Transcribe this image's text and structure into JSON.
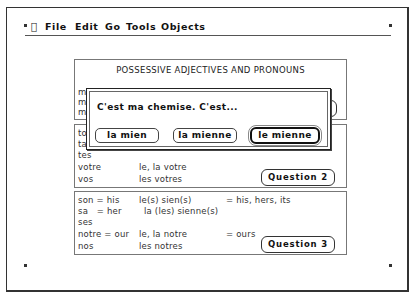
{
  "menubar": {
    "apple_icon": "",
    "items": [
      "File",
      "Edit",
      "Go",
      "Tools",
      "Objects"
    ]
  },
  "panel1": {
    "title": "POSSESSIVE ADJECTIVES AND PRONOUNS",
    "rows": [
      {
        "adj": "mon",
        "pron": "le(s) mien(s)",
        "meaning": "= mine",
        "obscured": true
      },
      {
        "adj": "ma"
      },
      {
        "adj": "mes"
      }
    ],
    "button": "Question 1"
  },
  "panel2": {
    "rows": [
      {
        "adj": "ton",
        "pron": ""
      },
      {
        "adj": "ta",
        "pron": ""
      },
      {
        "adj": "tes",
        "pron": ""
      },
      {
        "adj": "votre",
        "pron": "le, la votre"
      },
      {
        "adj": "vos",
        "pron": "les votres"
      }
    ],
    "button": "Question 2"
  },
  "panel3": {
    "rows": [
      {
        "adj": "son = his",
        "pron": "le(s) sien(s)",
        "meaning": "= his, hers, its"
      },
      {
        "adj": "sa   = her",
        "pron": "la (les) sienne(s)",
        "meaning": ""
      },
      {
        "adj": "ses",
        "pron": "",
        "meaning": ""
      },
      {
        "adj": "notre = our",
        "pron": "le, la notre",
        "meaning": "= ours"
      },
      {
        "adj": "nos",
        "pron": "les notres",
        "meaning": ""
      }
    ],
    "button": "Question 3"
  },
  "dialog": {
    "prompt": "C'est ma chemise. C'est...",
    "answers": [
      {
        "label": "la mien",
        "default": false
      },
      {
        "label": "la mienne",
        "default": false
      },
      {
        "label": "le mienne",
        "default": true
      }
    ]
  }
}
